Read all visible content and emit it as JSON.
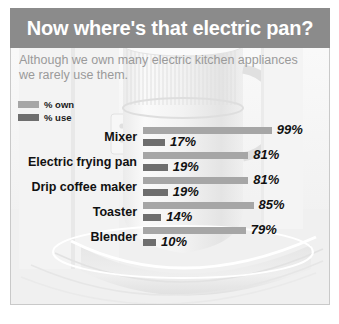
{
  "header": {
    "title": "Now where's that electric pan?"
  },
  "subtitle": "Although we own many electric kitchen appliances we rarely use them.",
  "legend": {
    "items": [
      {
        "label": "% own",
        "color": "#a6a6a6",
        "key": "own"
      },
      {
        "label": "% use",
        "color": "#6e6e6e",
        "key": "use"
      }
    ]
  },
  "colors": {
    "header_band": "#8b8b8b",
    "own_bar": "#a6a6a6",
    "use_bar": "#6e6e6e",
    "subtitle_text": "#9a9a9a",
    "frame": "#c9c9c9"
  },
  "chart_data": {
    "type": "bar",
    "title": "Now where's that electric pan?",
    "subtitle": "Although we own many electric kitchen appliances we rarely use them.",
    "orientation": "horizontal",
    "grouped": true,
    "categories": [
      "Mixer",
      "Electric frying pan",
      "Drip coffee maker",
      "Toaster",
      "Blender"
    ],
    "series": [
      {
        "name": "% own",
        "values": [
          99,
          81,
          81,
          85,
          79
        ],
        "labels": [
          "99%",
          "81%",
          "81%",
          "85%",
          "79%"
        ],
        "color": "#a6a6a6"
      },
      {
        "name": "% use",
        "values": [
          17,
          19,
          19,
          14,
          10
        ],
        "labels": [
          "17%",
          "19%",
          "19%",
          "14%",
          "10%"
        ],
        "color": "#6e6e6e"
      }
    ],
    "xlabel": "",
    "ylabel": "",
    "xlim": [
      0,
      100
    ],
    "grid": false,
    "legend_position": "top-left"
  }
}
